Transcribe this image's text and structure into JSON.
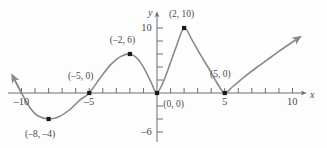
{
  "figure": {
    "kind": "cartesian-graph",
    "background": "#fdfdfd",
    "curve_color": "#8a8a8a",
    "axis_color": "#6e6e6e",
    "label_color": "#4a4a4a",
    "point_color": "#1a1a1a"
  },
  "axes": {
    "x_axis_label": "x",
    "y_axis_label": "y",
    "x_ticks": [
      {
        "value": -10,
        "label": "–10"
      },
      {
        "value": -9,
        "label": ""
      },
      {
        "value": -8,
        "label": ""
      },
      {
        "value": -7,
        "label": ""
      },
      {
        "value": -6,
        "label": ""
      },
      {
        "value": -5,
        "label": "–5"
      },
      {
        "value": -4,
        "label": ""
      },
      {
        "value": -3,
        "label": ""
      },
      {
        "value": -2,
        "label": ""
      },
      {
        "value": -1,
        "label": ""
      },
      {
        "value": 1,
        "label": ""
      },
      {
        "value": 2,
        "label": ""
      },
      {
        "value": 3,
        "label": ""
      },
      {
        "value": 4,
        "label": ""
      },
      {
        "value": 5,
        "label": "5"
      },
      {
        "value": 6,
        "label": ""
      },
      {
        "value": 7,
        "label": ""
      },
      {
        "value": 8,
        "label": ""
      },
      {
        "value": 9,
        "label": ""
      },
      {
        "value": 10,
        "label": "10"
      }
    ],
    "y_ticks": [
      {
        "value": 10,
        "label": "10"
      },
      {
        "value": 8,
        "label": ""
      },
      {
        "value": 6,
        "label": ""
      },
      {
        "value": 4,
        "label": ""
      },
      {
        "value": 2,
        "label": ""
      },
      {
        "value": -2,
        "label": ""
      },
      {
        "value": -4,
        "label": ""
      },
      {
        "value": -6,
        "label": "–6"
      }
    ],
    "xlim": [
      -11.2,
      11.5
    ],
    "ylim": [
      -8.5,
      11.5
    ],
    "grid": false
  },
  "chart_data": {
    "type": "line",
    "title": "",
    "xlabel": "x",
    "ylabel": "y",
    "xlim": [
      -11.2,
      11.5
    ],
    "ylim": [
      -8.5,
      11.5
    ],
    "grid": false,
    "legend": "none",
    "series": [
      {
        "name": "polynomial curve",
        "color": "#8a8a8a",
        "arrow_start": true,
        "arrow_end": true,
        "x": [
          -10.6,
          -10.0,
          -9.4,
          -8.8,
          -8.0,
          -7.2,
          -6.4,
          -5.7,
          -5.0,
          -4.2,
          -3.4,
          -2.7,
          -2.0,
          -1.4,
          -0.9,
          -0.45,
          0.0,
          0.5,
          0.95,
          1.4,
          2.0,
          2.6,
          3.2,
          3.9,
          4.5,
          5.0,
          5.6,
          6.4,
          7.4,
          8.4,
          9.4,
          10.4
        ],
        "y": [
          2.4,
          0.0,
          -2.2,
          -3.5,
          -4.0,
          -3.6,
          -2.5,
          -1.1,
          0.0,
          2.3,
          4.4,
          5.6,
          6.0,
          5.2,
          3.6,
          1.7,
          0.0,
          1.9,
          4.4,
          7.0,
          10.0,
          8.1,
          5.9,
          3.5,
          1.3,
          0.0,
          1.0,
          2.4,
          4.0,
          5.5,
          7.0,
          8.4
        ]
      }
    ],
    "marked_points": [
      {
        "label": "(–8, –4)",
        "x": -8,
        "y": -4,
        "label_dx": -4,
        "label_dy": 16
      },
      {
        "label": "(–5, 0)",
        "x": -5,
        "y": 0,
        "label_dx": -4,
        "label_dy": -16
      },
      {
        "label": "(–2, 6)",
        "x": -2,
        "y": 6,
        "label_dx": -3,
        "label_dy": -13
      },
      {
        "label": "(0, 0)",
        "x": 0,
        "y": 0,
        "label_dx": 21,
        "label_dy": 12
      },
      {
        "label": "(2, 10)",
        "x": 2,
        "y": 10,
        "label_dx": 2,
        "label_dy": -13
      },
      {
        "label": "(5, 0)",
        "x": 5,
        "y": 0,
        "label_dx": 0,
        "label_dy": -18
      }
    ]
  }
}
